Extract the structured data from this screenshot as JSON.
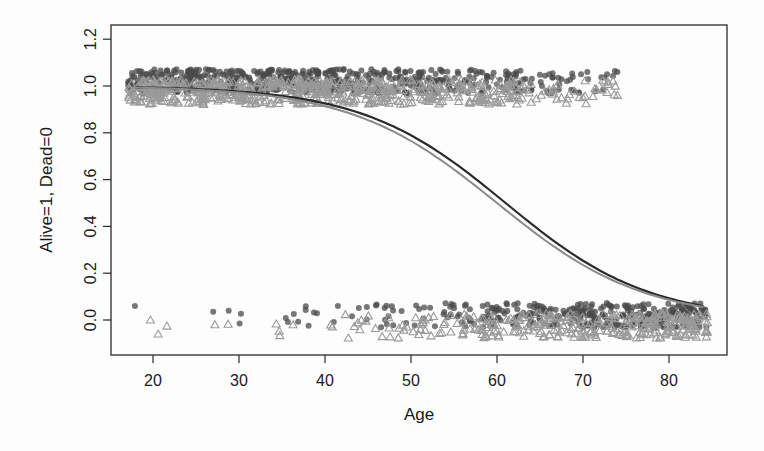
{
  "chart_data": {
    "type": "scatter",
    "title": "",
    "xlabel": "Age",
    "ylabel": "Alive=1, Dead=0",
    "xlim": [
      15.1,
      86.7
    ],
    "ylim": [
      -0.09,
      1.24
    ],
    "x_ticks": [
      20,
      30,
      40,
      50,
      60,
      70,
      80
    ],
    "x_tick_labels": [
      "20",
      "30",
      "40",
      "50",
      "60",
      "70",
      "80"
    ],
    "y_ticks": [
      0.0,
      0.2,
      0.4,
      0.6,
      0.8,
      1.0,
      1.2
    ],
    "y_tick_labels": [
      "0.0",
      "0.2",
      "0.4",
      "0.6",
      "0.8",
      "1.0",
      "1.2"
    ],
    "grid": false,
    "legend": null,
    "series": [
      {
        "name": "group-circles",
        "marker": "circle",
        "color": "#4a4a4a",
        "alive_age_range": [
          17,
          74
        ],
        "dead_age_range": [
          18,
          84
        ],
        "jitter_y": 0.07,
        "sample_points": [
          {
            "x": 17.9,
            "y": 0.06
          },
          {
            "x": 27.0,
            "y": 0.035
          },
          {
            "x": 28.8,
            "y": 0.04
          },
          {
            "x": 41.5,
            "y": 0.06
          },
          {
            "x": 55.0,
            "y": 0.05
          },
          {
            "x": 70.5,
            "y": 1.06
          },
          {
            "x": 72.8,
            "y": 1.05
          },
          {
            "x": 74.0,
            "y": 1.06
          },
          {
            "x": 84.0,
            "y": 0.03
          }
        ]
      },
      {
        "name": "group-triangles",
        "marker": "triangle",
        "color": "#9a9a9a",
        "alive_age_range": [
          17,
          74
        ],
        "dead_age_range": [
          19,
          84
        ],
        "jitter_y": 0.07,
        "sample_points": [
          {
            "x": 19.7,
            "y": 0.0
          },
          {
            "x": 20.6,
            "y": -0.06
          },
          {
            "x": 27.2,
            "y": -0.02
          },
          {
            "x": 67.5,
            "y": 0.95
          },
          {
            "x": 70.0,
            "y": 0.95
          },
          {
            "x": 74.0,
            "y": 0.96
          },
          {
            "x": 83.0,
            "y": -0.04
          }
        ]
      }
    ],
    "curves": [
      {
        "name": "logistic-fit-dark",
        "color": "#2a2a2a",
        "width": 2.2,
        "intercept": 7.32,
        "slope": -0.12,
        "x_range": [
          18,
          84
        ],
        "points": [
          [
            20,
            0.993
          ],
          [
            30,
            0.976
          ],
          [
            40,
            0.926
          ],
          [
            50,
            0.789
          ],
          [
            60,
            0.53
          ],
          [
            70,
            0.253
          ],
          [
            80,
            0.093
          ],
          [
            84,
            0.063
          ]
        ]
      },
      {
        "name": "logistic-fit-light",
        "color": "#8a8a8a",
        "width": 2.0,
        "intercept": 7.08,
        "slope": -0.118,
        "x_range": [
          18,
          84
        ],
        "points": [
          [
            20,
            0.992
          ],
          [
            30,
            0.972
          ],
          [
            40,
            0.915
          ],
          [
            50,
            0.762
          ],
          [
            60,
            0.485
          ],
          [
            70,
            0.216
          ],
          [
            80,
            0.079
          ],
          [
            84,
            0.055
          ]
        ]
      }
    ],
    "counts_approx": {
      "alive_points": 900,
      "dead_points": 420
    }
  },
  "labels": {
    "xlabel": "Age",
    "ylabel": "Alive=1, Dead=0"
  }
}
